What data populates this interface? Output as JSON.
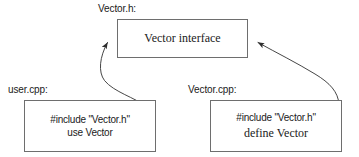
{
  "diagram": {
    "background_color": "#ffffff",
    "stroke_color": "#6e6e6e",
    "arrow_color": "#3c3c3c",
    "text_color": "#1a1a1a",
    "nodes": [
      {
        "id": "header",
        "label": "Vector.h:",
        "lines": [
          "Vector interface"
        ]
      },
      {
        "id": "user",
        "label": "user.cpp:",
        "lines": [
          "#include \"Vector.h\"",
          "use Vector"
        ]
      },
      {
        "id": "impl",
        "label": "Vector.cpp:",
        "lines": [
          "#include \"Vector.h\"",
          "define Vector"
        ]
      }
    ],
    "edges": [
      {
        "id": "user-includes-header",
        "from": "user",
        "to": "header",
        "arrowhead": "to"
      },
      {
        "id": "impl-includes-header",
        "from": "impl",
        "to": "header",
        "arrowhead": "to"
      }
    ]
  }
}
